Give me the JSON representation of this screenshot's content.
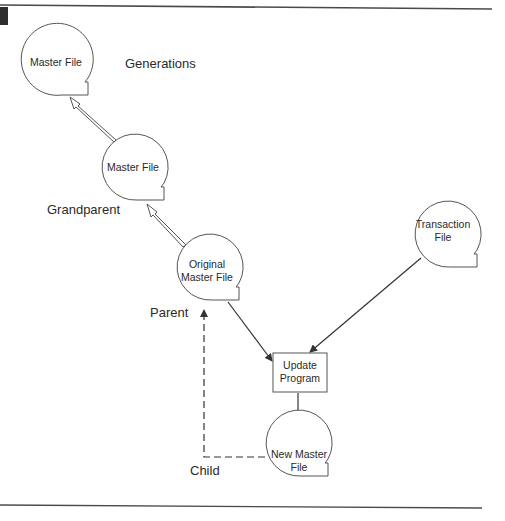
{
  "diagram": {
    "title": "Generations",
    "nodes": {
      "master_file_top": {
        "label": "Master File"
      },
      "master_file_grandparent": {
        "label": "Master File"
      },
      "original_master_file": {
        "line1": "Original",
        "line2": "Master File"
      },
      "transaction_file": {
        "line1": "Transaction",
        "line2": "File"
      },
      "update_program": {
        "line1": "Update",
        "line2": "Program"
      },
      "new_master_file": {
        "line1": "New Master",
        "line2": "File"
      }
    },
    "captions": {
      "generations": "Generations",
      "grandparent": "Grandparent",
      "parent": "Parent",
      "child": "Child"
    },
    "colors": {
      "stroke": "#555555",
      "text": "#2a2a2a",
      "rule": "#4a4a4a",
      "corner_block": "#2e2e2e"
    }
  }
}
